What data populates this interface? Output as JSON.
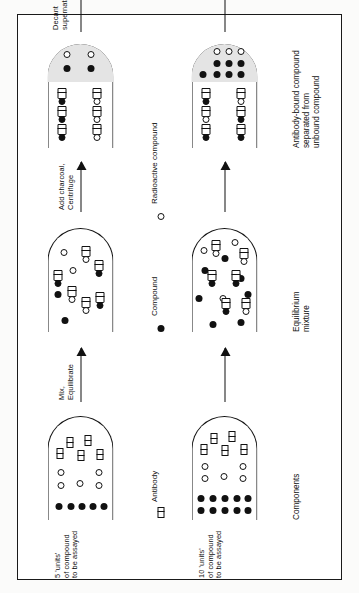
{
  "figure": {
    "stage_labels": [
      "Components",
      "Equilibrium mixture",
      "Antibody-bound compound separated from unbound compound",
      "Radioactivity to be measured"
    ],
    "stage_captions": [
      {
        "line1": "Components",
        "line2": ""
      },
      {
        "line1": "Equilibrium",
        "line2": "mixture"
      },
      {
        "line1": "Antibody-bound compound",
        "line2": "separated from",
        "line3": "unbound compound"
      },
      {
        "line1": "Radioactivity",
        "line2": "to be measured"
      }
    ],
    "arrow_labels": [
      {
        "line1": "Mix,",
        "line2": "Equilibrate"
      },
      {
        "line1": "Add charcoal,",
        "line2": "Centrifuge"
      },
      {
        "line1": "Decant",
        "line2": "supernatant"
      }
    ],
    "row_labels": [
      {
        "line1": "5 'units'",
        "line2": "of compound",
        "line3": "to be assayed"
      },
      {
        "line1": "10 'units'",
        "line2": "of compound",
        "line3": "to be assayed"
      }
    ],
    "legend": [
      {
        "glyph": "antibody-glyph",
        "label": "Antibody"
      },
      {
        "glyph": "compound-glyph",
        "label": "Compound"
      },
      {
        "glyph": "radioactive-compound-glyph",
        "label": "Radioactive compound"
      }
    ],
    "colors": {
      "ink": "#111111",
      "paper": "#ffffff",
      "plate_bg": "#fbfbfa",
      "pellet_shade": "#e4e4e4"
    },
    "counts": {
      "row_top": {
        "compound": 5,
        "radioactive_compound": 5,
        "antibody": 5,
        "bound_labeled": 3,
        "bound_unlabeled": 3,
        "supernatant_labeled": 3,
        "supernatant_unlabeled": 3
      },
      "row_bottom": {
        "compound": 10,
        "radioactive_compound": 5,
        "antibody": 5,
        "bound_labeled": 2,
        "bound_unlabeled": 4,
        "supernatant_labeled": 4,
        "supernatant_unlabeled": 2
      }
    }
  }
}
